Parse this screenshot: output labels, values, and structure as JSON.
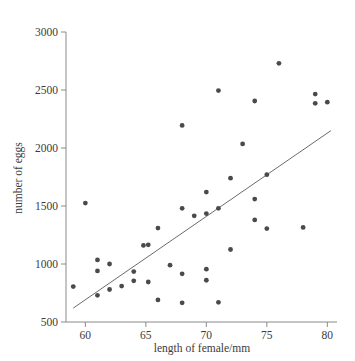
{
  "chart_data": {
    "type": "scatter",
    "title": "",
    "xlabel": "length of female/mm",
    "ylabel": "number of eggs",
    "xlim": [
      58.4,
      80.8
    ],
    "ylim": [
      500,
      3000
    ],
    "xticks": [
      60,
      65,
      70,
      75,
      80
    ],
    "xtick_labels": [
      "60",
      "65",
      "70",
      "75",
      "80"
    ],
    "yticks": [
      500,
      1000,
      1500,
      2000,
      2500,
      3000
    ],
    "ytick_labels": [
      "500",
      "1000",
      "1500",
      "2000",
      "2500",
      "3000"
    ],
    "grid": false,
    "legend": false,
    "marker_color": "#4a4a4a",
    "line_color": "#6b6b6b",
    "axis_color": "#8a8a8a",
    "points": [
      {
        "x": 59.0,
        "y": 805
      },
      {
        "x": 60.0,
        "y": 1525
      },
      {
        "x": 61.0,
        "y": 1035
      },
      {
        "x": 61.0,
        "y": 940
      },
      {
        "x": 61.0,
        "y": 730
      },
      {
        "x": 62.0,
        "y": 1000
      },
      {
        "x": 62.0,
        "y": 780
      },
      {
        "x": 63.0,
        "y": 810
      },
      {
        "x": 64.0,
        "y": 935
      },
      {
        "x": 64.0,
        "y": 855
      },
      {
        "x": 64.8,
        "y": 1160
      },
      {
        "x": 65.2,
        "y": 1165
      },
      {
        "x": 65.2,
        "y": 845
      },
      {
        "x": 66.0,
        "y": 1310
      },
      {
        "x": 66.0,
        "y": 690
      },
      {
        "x": 67.0,
        "y": 990
      },
      {
        "x": 68.0,
        "y": 2195
      },
      {
        "x": 68.0,
        "y": 1480
      },
      {
        "x": 68.0,
        "y": 915
      },
      {
        "x": 68.0,
        "y": 665
      },
      {
        "x": 69.0,
        "y": 1415
      },
      {
        "x": 70.0,
        "y": 1620
      },
      {
        "x": 70.0,
        "y": 1435
      },
      {
        "x": 70.0,
        "y": 955
      },
      {
        "x": 70.0,
        "y": 860
      },
      {
        "x": 71.0,
        "y": 2495
      },
      {
        "x": 71.0,
        "y": 1480
      },
      {
        "x": 71.0,
        "y": 670
      },
      {
        "x": 72.0,
        "y": 1740
      },
      {
        "x": 72.0,
        "y": 1125
      },
      {
        "x": 73.0,
        "y": 2035
      },
      {
        "x": 74.0,
        "y": 2405
      },
      {
        "x": 74.0,
        "y": 1560
      },
      {
        "x": 74.0,
        "y": 1380
      },
      {
        "x": 75.0,
        "y": 1770
      },
      {
        "x": 75.0,
        "y": 1305
      },
      {
        "x": 76.0,
        "y": 2730
      },
      {
        "x": 78.0,
        "y": 1315
      },
      {
        "x": 79.0,
        "y": 2465
      },
      {
        "x": 79.0,
        "y": 2385
      },
      {
        "x": 80.0,
        "y": 2395
      }
    ],
    "fit_line": {
      "x1": 59.0,
      "y1": 620,
      "x2": 80.3,
      "y2": 2150
    }
  }
}
